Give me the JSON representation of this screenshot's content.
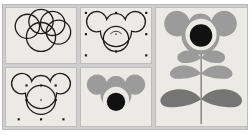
{
  "figure": {
    "background_color": "#ffffff",
    "frame_color": "#cfcfcf",
    "panel_background": "#eceae6",
    "panel_border": "#bdbdbd",
    "outline_color": "#1d1d1d",
    "layout": "2x2 grid of construction steps at left, one large result panel at right"
  },
  "palette": {
    "petal_gray": "#9b9b9b",
    "leaf_light_gray": "#9b9b9b",
    "leaf_dark_gray": "#757575",
    "center_black": "#111111",
    "inner_ring_light": "#eceae6",
    "stem_gray": "#8c8c8c",
    "handle_black": "#161616"
  },
  "panels": [
    {
      "id": "outline-circles",
      "name": "step-1-overlapping-circles",
      "caption": "Five overlapping circle outlines",
      "position": "top-left",
      "style": "outline",
      "shape_count": 5,
      "selected": false
    },
    {
      "id": "merged-outline",
      "name": "step-2-merged-outline",
      "caption": "Circles united into a single cloud outline with a circle on top",
      "position": "top-middle",
      "style": "outline",
      "shape_count": 2,
      "selected": true,
      "handles": 8
    },
    {
      "id": "outline-stack",
      "name": "step-3-outline-stack",
      "caption": "Cloud outline with centered circle selected",
      "position": "bottom-left",
      "style": "outline",
      "shape_count": 2,
      "selected": true,
      "handles": 8
    },
    {
      "id": "filled-bloom",
      "name": "step-4-filled-bloom",
      "caption": "Bloom filled gray with black center disc",
      "position": "bottom-middle",
      "style": "filled",
      "shape_count": 2,
      "selected": false
    },
    {
      "id": "final-flower",
      "name": "step-5-final-flower",
      "caption": "Finished flower: gray petals, black center, two small leaf pairs and one large leaf pair on a stem",
      "position": "right",
      "style": "filled",
      "petal_lobes": 5,
      "leaf_pairs": 3,
      "selected": false
    }
  ]
}
